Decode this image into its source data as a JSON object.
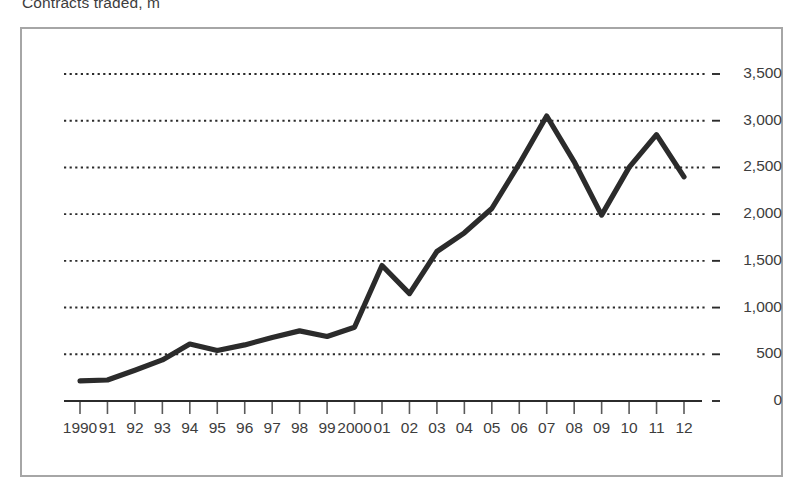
{
  "chart_data": {
    "type": "line",
    "title": "Contracts traded, m",
    "xlabel": "",
    "ylabel": "",
    "ylim": [
      0,
      3500
    ],
    "yticks": [
      0,
      500,
      1000,
      1500,
      2000,
      2500,
      3000,
      3500
    ],
    "ytick_labels": [
      "0",
      "500",
      "1,000",
      "1,500",
      "2,000",
      "2,500",
      "3,000",
      "3,500"
    ],
    "grid": true,
    "grid_style": "dotted",
    "legend": null,
    "line_color": "#2b2b2b",
    "categories": [
      "1990",
      "91",
      "92",
      "93",
      "94",
      "95",
      "96",
      "97",
      "98",
      "99",
      "2000",
      "01",
      "02",
      "03",
      "04",
      "05",
      "06",
      "07",
      "08",
      "09",
      "10",
      "11",
      "12"
    ],
    "x_values": [
      1990,
      1991,
      1992,
      1993,
      1994,
      1995,
      1996,
      1997,
      1998,
      1999,
      2000,
      2001,
      2002,
      2003,
      2004,
      2005,
      2006,
      2007,
      2008,
      2009,
      2010,
      2011,
      2012
    ],
    "values": [
      215,
      225,
      330,
      440,
      610,
      540,
      600,
      680,
      750,
      690,
      790,
      1450,
      1150,
      1600,
      1800,
      2060,
      2540,
      3050,
      2560,
      1990,
      2500,
      2850,
      2400
    ]
  },
  "frame": {
    "border_color": "#a6a6a6"
  }
}
